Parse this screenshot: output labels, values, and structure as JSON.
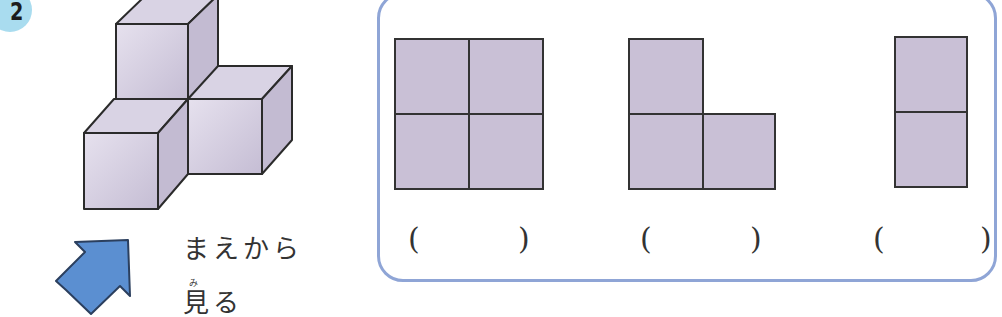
{
  "problem": {
    "number": "2",
    "badge_color": "#a9dcef",
    "direction_caption_line1": "まえから",
    "direction_caption_line2": "見る",
    "ruby_mi": "み",
    "arrow_color": "#5b8fd1",
    "cube_color": "#cdc6db",
    "cube_count": 4
  },
  "answer_panel": {
    "border_color": "#8fa5d6",
    "cell_color": "#c9c0d6",
    "views": [
      {
        "shape": "2x2 square",
        "answer_open": "(",
        "answer_close": ")"
      },
      {
        "shape": "L shape",
        "answer_open": "(",
        "answer_close": ")"
      },
      {
        "shape": "1x2 vertical",
        "answer_open": "(",
        "answer_close": ")"
      }
    ]
  }
}
